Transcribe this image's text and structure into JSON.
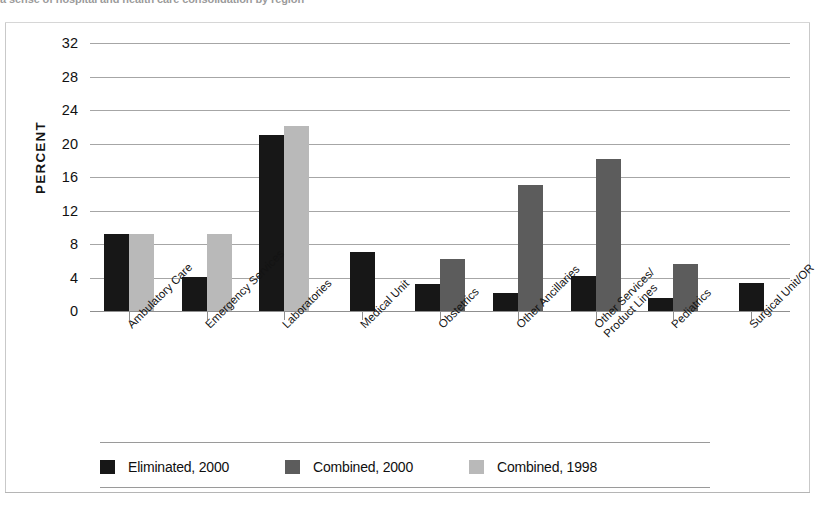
{
  "caption_sliver": "a sense of hospital and health care consolidation by region",
  "axis": {
    "y_title": "PERCENT",
    "y_ticks": [
      32,
      28,
      24,
      20,
      16,
      12,
      8,
      4,
      0
    ]
  },
  "legend": {
    "items": [
      {
        "label": "Eliminated, 2000",
        "color": "#171717"
      },
      {
        "label": "Combined, 2000",
        "color": "#5c5c5c"
      },
      {
        "label": "Combined, 1998",
        "color": "#b9b9b9"
      }
    ]
  },
  "chart_data": {
    "type": "bar",
    "title": "",
    "xlabel": "",
    "ylabel": "PERCENT",
    "ylim": [
      0,
      32
    ],
    "ytick_step": 4,
    "grid": true,
    "legend_position": "bottom",
    "orientation": "vertical",
    "grouped": true,
    "categories": [
      "Ambulatory Care",
      "Emergency Services",
      "Laboratories",
      "Medical Unit",
      "Obstetrics",
      "Other Ancillaries",
      "Other Services/ Product Lines",
      "Pediatrics",
      "Surgical Unit/OR"
    ],
    "category_lines": [
      [
        "Ambulatory Care"
      ],
      [
        "Emergency Services"
      ],
      [
        "Laboratories"
      ],
      [
        "Medical Unit"
      ],
      [
        "Obstetrics"
      ],
      [
        "Other Ancillaries"
      ],
      [
        "Other Services/",
        "Product Lines"
      ],
      [
        "Pediatrics"
      ],
      [
        "Surgical Unit/OR"
      ]
    ],
    "series": [
      {
        "name": "Eliminated, 2000",
        "color": "#171717",
        "values": [
          9.2,
          4.1,
          21.0,
          7.0,
          3.2,
          2.2,
          4.2,
          1.5,
          3.4
        ]
      },
      {
        "name": "Combined, 2000",
        "color": "#5c5c5c",
        "values": [
          null,
          null,
          null,
          null,
          6.2,
          15.1,
          18.2,
          5.6,
          null
        ]
      },
      {
        "name": "Combined, 1998",
        "color": "#b9b9b9",
        "values": [
          9.2,
          9.2,
          22.1,
          null,
          null,
          null,
          null,
          null,
          null
        ]
      }
    ]
  }
}
